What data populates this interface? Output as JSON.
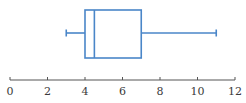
{
  "chart_data": {
    "type": "box",
    "title": "",
    "xlabel": "",
    "ylabel": "",
    "xlim": [
      0,
      12
    ],
    "grid": false,
    "legend": null,
    "x_ticks": [
      0,
      2,
      4,
      6,
      8,
      10,
      12
    ],
    "x_tick_labels": [
      "0",
      "2",
      "4",
      "6",
      "8",
      "10",
      "12"
    ],
    "orientation": "horizontal",
    "box": {
      "min": 3,
      "q1": 4,
      "median": 4.5,
      "q3": 7,
      "max": 11
    },
    "colors": {
      "box": "#4a86c8",
      "axis": "#555555"
    }
  }
}
